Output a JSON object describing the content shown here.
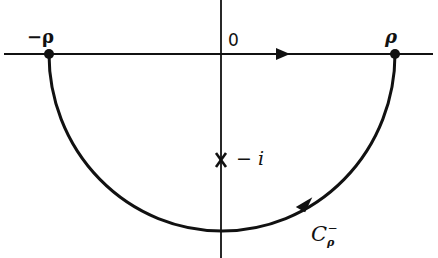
{
  "diagram": {
    "type": "contour",
    "colors": {
      "stroke": "#111111",
      "background": "#ffffff"
    },
    "axes": {
      "real_axis": {
        "y": 54,
        "x_start": 4,
        "x_end": 433
      },
      "imag_axis": {
        "x": 221,
        "y_start": 0,
        "y_end": 258
      }
    },
    "points": [
      {
        "id": "neg-rho",
        "label": "−ρ",
        "x": 49,
        "y": 54
      },
      {
        "id": "rho",
        "label": "ρ",
        "x": 395,
        "y": 54
      }
    ],
    "origin_label": "0",
    "pole": {
      "label_minus": "−",
      "label_i": "i",
      "marker": "x-mark",
      "x": 221,
      "y": 160
    },
    "contour": {
      "name_main": "C",
      "name_sub": "ρ",
      "name_sup": "−",
      "arc_center": {
        "x": 222,
        "y": 54
      },
      "rx": 173,
      "ry": 177
    },
    "arrows": [
      {
        "id": "axis-arrow",
        "direction": "right"
      },
      {
        "id": "arc-arrow",
        "direction": "counterclockwise"
      }
    ]
  }
}
